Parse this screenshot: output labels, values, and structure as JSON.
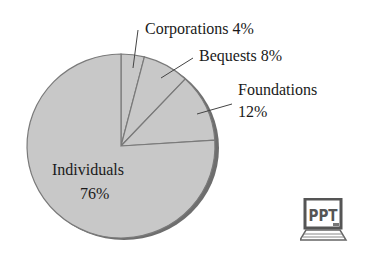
{
  "chart_data": {
    "type": "pie",
    "title": "",
    "start_angle": "12 o'clock, clockwise",
    "categories": [
      "Corporations",
      "Bequests",
      "Foundations",
      "Individuals"
    ],
    "values": [
      4,
      8,
      12,
      76
    ],
    "unit": "%",
    "labels": [
      {
        "name": "Corporations",
        "text": "Corporations 4%"
      },
      {
        "name": "Bequests",
        "text": "Bequests 8%"
      },
      {
        "name": "Foundations",
        "text_line1": "Foundations",
        "text_line2": "12%"
      },
      {
        "name": "Individuals",
        "text_line1": "Individuals",
        "text_line2": "76%"
      }
    ],
    "colors": {
      "fill": "#c8c8c8",
      "edge": "#7a7a7a",
      "shadow": "#6e6e6e"
    }
  },
  "badge": {
    "text": "PPT"
  }
}
